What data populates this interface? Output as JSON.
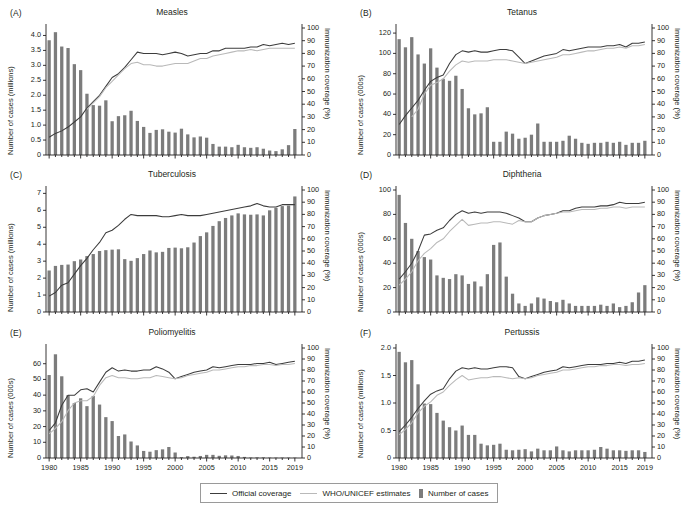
{
  "figure": {
    "legend": {
      "official_label": "Official coverage",
      "estimates_label": "WHO/UNICEF estimates",
      "cases_label": "Number of cases"
    },
    "colors": {
      "bar": "#7c7c7c",
      "official_line": "#3c3c3c",
      "estimates_line": "#b9b9b9",
      "axis": "#231f20"
    },
    "x_tick_labels": [
      "1980",
      "1985",
      "1990",
      "1995",
      "2000",
      "2005",
      "2010",
      "2015",
      "2019"
    ],
    "x_tick_years": [
      1980,
      1985,
      1990,
      1995,
      2000,
      2005,
      2010,
      2015,
      2019
    ],
    "right_axis_label": "Immunization coverage (%)",
    "right_ticks": [
      0,
      10,
      20,
      30,
      40,
      50,
      60,
      70,
      80,
      90,
      100
    ]
  },
  "chart_data": [
    {
      "type": "bar",
      "panel": "(A)",
      "title": "Measles",
      "xlabel": "",
      "ylabel": "Number of cases (millions)",
      "ylabel_right": "Immunization coverage (%)",
      "ylim": [
        0,
        4.25
      ],
      "yticks": [
        0,
        0.5,
        1.0,
        1.5,
        2.0,
        2.5,
        3.0,
        3.5,
        4.0
      ],
      "ytick_labels": [
        "0",
        "0.5",
        "1.0",
        "1.5",
        "2.0",
        "2.5",
        "3.0",
        "3.5",
        "4.0"
      ],
      "ylim_right": [
        0,
        100
      ],
      "x": [
        1980,
        1981,
        1982,
        1983,
        1984,
        1985,
        1986,
        1987,
        1988,
        1989,
        1990,
        1991,
        1992,
        1993,
        1994,
        1995,
        1996,
        1997,
        1998,
        1999,
        2000,
        2001,
        2002,
        2003,
        2004,
        2005,
        2006,
        2007,
        2008,
        2009,
        2010,
        2011,
        2012,
        2013,
        2014,
        2015,
        2016,
        2017,
        2018,
        2019
      ],
      "values": [
        3.84,
        4.11,
        3.63,
        3.58,
        3.04,
        2.84,
        2.05,
        1.67,
        1.65,
        1.83,
        1.13,
        1.3,
        1.33,
        1.48,
        1.14,
        0.94,
        0.74,
        0.84,
        0.86,
        0.78,
        0.75,
        0.88,
        0.69,
        0.59,
        0.62,
        0.58,
        0.37,
        0.28,
        0.28,
        0.26,
        0.34,
        0.26,
        0.24,
        0.26,
        0.21,
        0.15,
        0.13,
        0.19,
        0.33,
        0.87
      ],
      "series": [
        {
          "name": "Official coverage",
          "values": [
            14,
            17,
            19,
            22,
            26,
            30,
            37,
            42,
            47,
            54,
            61,
            64,
            69,
            75,
            81,
            80,
            80,
            80,
            79,
            80,
            81,
            80,
            78,
            79,
            80,
            80,
            82,
            82,
            84,
            84,
            84,
            84,
            85,
            85,
            87,
            86,
            87,
            88,
            87,
            88
          ]
        },
        {
          "name": "WHO/UNICEF estimates",
          "values": [
            null,
            null,
            null,
            null,
            null,
            null,
            36,
            41,
            46,
            53,
            58,
            63,
            68,
            72,
            73,
            71,
            71,
            70,
            70,
            71,
            72,
            72,
            72,
            74,
            76,
            76,
            78,
            79,
            80,
            81,
            82,
            82,
            83,
            82,
            83,
            84,
            84,
            84,
            84,
            84
          ]
        }
      ],
      "grid": false,
      "legend_position": "figure-bottom"
    },
    {
      "type": "bar",
      "panel": "(B)",
      "title": "Tetanus",
      "xlabel": "",
      "ylabel": "Number of cases (000s)",
      "ylabel_right": "Immunization coverage (%)",
      "ylim": [
        0,
        125
      ],
      "yticks": [
        0,
        20,
        40,
        60,
        80,
        100,
        120
      ],
      "ytick_labels": [
        "0",
        "20",
        "40",
        "60",
        "80",
        "100",
        "120"
      ],
      "ylim_right": [
        0,
        100
      ],
      "x": [
        1980,
        1981,
        1982,
        1983,
        1984,
        1985,
        1986,
        1987,
        1988,
        1989,
        1990,
        1991,
        1992,
        1993,
        1994,
        1995,
        1996,
        1997,
        1998,
        1999,
        2000,
        2001,
        2002,
        2003,
        2004,
        2005,
        2006,
        2007,
        2008,
        2009,
        2010,
        2011,
        2012,
        2013,
        2014,
        2015,
        2016,
        2017,
        2018,
        2019
      ],
      "values": [
        114,
        106,
        116,
        99,
        90,
        105,
        86,
        75,
        73,
        78,
        65,
        46,
        40,
        41,
        47,
        13,
        13,
        23,
        21,
        16,
        17,
        20,
        31,
        13,
        13,
        13,
        14,
        19,
        16,
        12,
        11,
        12,
        12,
        13,
        12,
        13,
        10,
        12,
        12,
        14
      ],
      "series": [
        {
          "name": "Official coverage",
          "values": [
            24,
            31,
            37,
            43,
            51,
            58,
            61,
            63,
            72,
            79,
            82,
            81,
            82,
            81,
            81,
            82,
            83,
            83,
            82,
            77,
            72,
            74,
            76,
            78,
            79,
            80,
            83,
            82,
            83,
            84,
            85,
            85,
            85,
            86,
            86,
            87,
            85,
            88,
            88,
            89
          ]
        },
        {
          "name": "WHO/UNICEF estimates",
          "values": [
            null,
            null,
            30,
            36,
            48,
            55,
            57,
            60,
            66,
            71,
            74,
            73,
            74,
            74,
            74,
            75,
            75,
            75,
            74,
            73,
            72,
            73,
            74,
            75,
            76,
            77,
            79,
            79,
            80,
            81,
            82,
            82,
            83,
            84,
            84,
            85,
            84,
            86,
            86,
            87
          ]
        }
      ],
      "grid": false,
      "legend_position": "figure-bottom"
    },
    {
      "type": "bar",
      "panel": "(C)",
      "title": "Tuberculosis",
      "xlabel": "",
      "ylabel": "Number of cases (millions)",
      "ylabel_right": "Immunization coverage (%)",
      "ylim": [
        0,
        7.2
      ],
      "yticks": [
        0,
        1,
        2,
        3,
        4,
        5,
        6,
        7
      ],
      "ytick_labels": [
        "0",
        "1",
        "2",
        "3",
        "4",
        "5",
        "6",
        "7"
      ],
      "ylim_right": [
        0,
        100
      ],
      "x": [
        1980,
        1981,
        1982,
        1983,
        1984,
        1985,
        1986,
        1987,
        1988,
        1989,
        1990,
        1991,
        1992,
        1993,
        1994,
        1995,
        1996,
        1997,
        1998,
        1999,
        2000,
        2001,
        2002,
        2003,
        2004,
        2005,
        2006,
        2007,
        2008,
        2009,
        2010,
        2011,
        2012,
        2013,
        2014,
        2015,
        2016,
        2017,
        2018,
        2019
      ],
      "values": [
        2.45,
        2.72,
        2.78,
        2.8,
        3.0,
        3.1,
        3.3,
        3.42,
        3.6,
        3.65,
        3.68,
        3.7,
        3.12,
        3.02,
        3.18,
        3.42,
        3.63,
        3.52,
        3.55,
        3.78,
        3.8,
        3.76,
        3.82,
        4.1,
        4.48,
        4.7,
        5.08,
        5.36,
        5.55,
        5.7,
        5.82,
        5.76,
        5.74,
        5.76,
        5.7,
        6.0,
        6.15,
        6.25,
        6.28,
        6.82
      ],
      "series": [
        {
          "name": "Official coverage",
          "values": [
            13,
            16,
            22,
            24,
            31,
            38,
            44,
            51,
            57,
            65,
            67,
            71,
            76,
            80,
            79,
            79,
            79,
            79,
            78,
            78,
            79,
            80,
            79,
            79,
            79,
            80,
            81,
            82,
            83,
            84,
            85,
            86,
            87,
            89,
            87,
            86,
            86,
            88,
            88,
            88
          ]
        }
      ],
      "grid": false,
      "legend_position": "figure-bottom"
    },
    {
      "type": "bar",
      "panel": "(D)",
      "title": "Diphtheria",
      "xlabel": "",
      "ylabel": "Number of cases (000s)",
      "ylabel_right": "Immunization coverage (%)",
      "ylim": [
        0,
        100
      ],
      "yticks": [
        0,
        20,
        40,
        60,
        80,
        100
      ],
      "ytick_labels": [
        "0",
        "20",
        "40",
        "60",
        "80",
        "100"
      ],
      "ylim_right": [
        0,
        100
      ],
      "x": [
        1980,
        1981,
        1982,
        1983,
        1984,
        1985,
        1986,
        1987,
        1988,
        1989,
        1990,
        1991,
        1992,
        1993,
        1994,
        1995,
        1996,
        1997,
        1998,
        1999,
        2000,
        2001,
        2002,
        2003,
        2004,
        2005,
        2006,
        2007,
        2008,
        2009,
        2010,
        2011,
        2012,
        2013,
        2014,
        2015,
        2016,
        2017,
        2018,
        2019
      ],
      "values": [
        96,
        73,
        60,
        50,
        45,
        43,
        30,
        28,
        27,
        31,
        30,
        23,
        25,
        21,
        31,
        55,
        57,
        29,
        15,
        7,
        5,
        7,
        12,
        11,
        9,
        8,
        10,
        7,
        5,
        5,
        5,
        5,
        6,
        5,
        7,
        4,
        5,
        8,
        16,
        22
      ],
      "series": [
        {
          "name": "Official coverage",
          "values": [
            27,
            33,
            40,
            50,
            63,
            64,
            67,
            69,
            75,
            80,
            83,
            81,
            82,
            81,
            82,
            82,
            82,
            81,
            79,
            77,
            74,
            74,
            77,
            79,
            80,
            81,
            83,
            83,
            85,
            86,
            86,
            86,
            87,
            87,
            88,
            90,
            89,
            89,
            89,
            90
          ]
        },
        {
          "name": "WHO/UNICEF estimates",
          "values": [
            22,
            27,
            33,
            42,
            48,
            52,
            57,
            60,
            66,
            71,
            76,
            71,
            72,
            73,
            73,
            74,
            74,
            73,
            72,
            75,
            74,
            74,
            77,
            79,
            80,
            81,
            82,
            82,
            83,
            84,
            84,
            84,
            85,
            85,
            86,
            86,
            85,
            86,
            86,
            86
          ]
        }
      ],
      "grid": false,
      "legend_position": "figure-bottom"
    },
    {
      "type": "bar",
      "panel": "(E)",
      "title": "Poliomyelitis",
      "xlabel": "",
      "ylabel": "Number of cases (000s)",
      "ylabel_right": "Immunization coverage (%)",
      "ylim": [
        0,
        70
      ],
      "yticks": [
        0,
        10,
        20,
        30,
        40,
        50,
        60
      ],
      "ytick_labels": [
        "0",
        "10",
        "20",
        "30",
        "40",
        "50",
        "60"
      ],
      "ylim_right": [
        0,
        100
      ],
      "x": [
        1980,
        1981,
        1982,
        1983,
        1984,
        1985,
        1986,
        1987,
        1988,
        1989,
        1990,
        1991,
        1992,
        1993,
        1994,
        1995,
        1996,
        1997,
        1998,
        1999,
        2000,
        2001,
        2002,
        2003,
        2004,
        2005,
        2006,
        2007,
        2008,
        2009,
        2010,
        2011,
        2012,
        2013,
        2014,
        2015,
        2016,
        2017,
        2018,
        2019
      ],
      "values": [
        52.8,
        66.0,
        52.0,
        40.0,
        35.0,
        38.0,
        33.0,
        39.5,
        34.0,
        26.0,
        23.5,
        14.0,
        15.0,
        10.5,
        8.0,
        4.5,
        4.0,
        5.0,
        5.5,
        7.0,
        3.5,
        0.5,
        1.2,
        0.8,
        1.3,
        2.0,
        2.0,
        1.4,
        1.7,
        1.6,
        1.3,
        0.7,
        0.3,
        0.4,
        0.4,
        0.1,
        0.04,
        0.02,
        0.03,
        0.2
      ],
      "series": [
        {
          "name": "Official coverage",
          "values": [
            25,
            32,
            48,
            57,
            57,
            62,
            63,
            60,
            69,
            78,
            82,
            79,
            80,
            79,
            79,
            80,
            80,
            83,
            81,
            78,
            72,
            74,
            76,
            78,
            79,
            80,
            83,
            82,
            83,
            84,
            85,
            85,
            85,
            86,
            86,
            87,
            85,
            86,
            87,
            88
          ]
        },
        {
          "name": "WHO/UNICEF estimates",
          "values": [
            22,
            27,
            33,
            43,
            50,
            52,
            52,
            56,
            66,
            73,
            75,
            73,
            73,
            72,
            72,
            73,
            73,
            75,
            74,
            73,
            72,
            73,
            75,
            76,
            77,
            78,
            80,
            80,
            81,
            82,
            83,
            83,
            84,
            84,
            85,
            85,
            84,
            85,
            85,
            86
          ]
        }
      ],
      "grid": false,
      "legend_position": "figure-bottom"
    },
    {
      "type": "bar",
      "panel": "(F)",
      "title": "Pertussis",
      "xlabel": "",
      "ylabel": "Number of cases (millions)",
      "ylabel_right": "Immunization coverage (%)",
      "ylim": [
        0,
        2.0
      ],
      "yticks": [
        0,
        0.5,
        1.0,
        1.5,
        2.0
      ],
      "ytick_labels": [
        "0",
        "0.5",
        "1.0",
        "1.5",
        "2.0"
      ],
      "ylim_right": [
        0,
        100
      ],
      "x": [
        1980,
        1981,
        1982,
        1983,
        1984,
        1985,
        1986,
        1987,
        1988,
        1989,
        1990,
        1991,
        1992,
        1993,
        1994,
        1995,
        1996,
        1997,
        1998,
        1999,
        2000,
        2001,
        2002,
        2003,
        2004,
        2005,
        2006,
        2007,
        2008,
        2009,
        2010,
        2011,
        2012,
        2013,
        2014,
        2015,
        2016,
        2017,
        2018,
        2019
      ],
      "values": [
        1.93,
        1.74,
        1.78,
        1.34,
        0.99,
        0.98,
        0.82,
        0.68,
        0.56,
        0.5,
        0.59,
        0.42,
        0.42,
        0.26,
        0.23,
        0.24,
        0.26,
        0.15,
        0.14,
        0.15,
        0.16,
        0.12,
        0.17,
        0.14,
        0.14,
        0.21,
        0.14,
        0.12,
        0.14,
        0.14,
        0.14,
        0.15,
        0.2,
        0.17,
        0.14,
        0.14,
        0.13,
        0.14,
        0.14,
        0.11
      ],
      "series": [
        {
          "name": "Official coverage",
          "values": [
            24,
            30,
            37,
            45,
            52,
            58,
            61,
            63,
            72,
            79,
            82,
            81,
            82,
            81,
            81,
            82,
            83,
            83,
            82,
            74,
            72,
            74,
            76,
            78,
            79,
            80,
            83,
            82,
            83,
            84,
            85,
            85,
            85,
            86,
            86,
            87,
            86,
            88,
            88,
            89
          ]
        },
        {
          "name": "WHO/UNICEF estimates",
          "values": [
            21,
            26,
            32,
            41,
            47,
            51,
            57,
            60,
            66,
            71,
            75,
            71,
            72,
            73,
            73,
            74,
            74,
            73,
            72,
            73,
            72,
            73,
            75,
            76,
            77,
            78,
            80,
            80,
            81,
            82,
            83,
            83,
            84,
            84,
            85,
            85,
            84,
            85,
            85,
            86
          ]
        }
      ],
      "grid": false,
      "legend_position": "figure-bottom"
    }
  ]
}
